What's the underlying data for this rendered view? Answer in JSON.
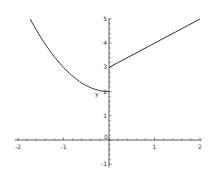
{
  "chart_data": {
    "type": "line",
    "title": "",
    "xlabel": "",
    "ylabel": "",
    "xlim": [
      -2,
      2
    ],
    "ylim": [
      -1,
      5
    ],
    "grid": false,
    "legend": null,
    "x_ticks": [
      -2,
      -1,
      0,
      1,
      2
    ],
    "y_ticks": [
      -1,
      0,
      1,
      2,
      3,
      4,
      5
    ],
    "x_tick_labels": [
      "-2",
      "-1",
      "0",
      "1",
      "2"
    ],
    "y_tick_labels": [
      "-1",
      "",
      "1",
      "2",
      "3",
      "4",
      "5"
    ],
    "annotations": [
      {
        "text": "y",
        "x": -0.2,
        "y": 1.9
      }
    ],
    "series": [
      {
        "name": "left piece (x^2 + 2, x < 0)",
        "x": [
          -1.73,
          -1.5,
          -1.25,
          -1.0,
          -0.75,
          -0.5,
          -0.25,
          0.0
        ],
        "y": [
          5.0,
          4.25,
          3.56,
          3.0,
          2.56,
          2.25,
          2.06,
          2.0
        ],
        "color": "#333333"
      },
      {
        "name": "right piece (x + 3, x >= 0)",
        "x": [
          0.0,
          2.0
        ],
        "y": [
          3.0,
          5.0
        ],
        "color": "#333333"
      }
    ]
  },
  "axes": {
    "color": "#333333"
  }
}
